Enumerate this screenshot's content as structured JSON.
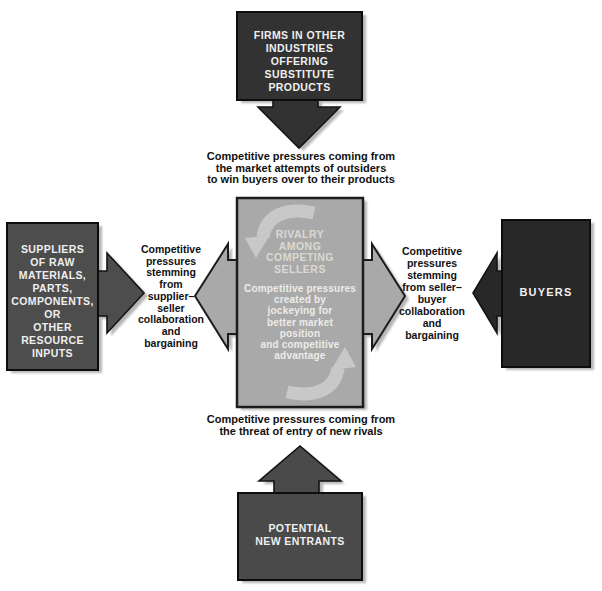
{
  "diagram": {
    "center": {
      "title": "RIVALRY\nAMONG\nCOMPETING\nSELLERS",
      "body": "Competitive pressures\ncreated by\njockeying for\nbetter market\nposition\nand competitive\nadvantage"
    },
    "boxes": {
      "top": {
        "label": "FIRMS IN OTHER\nINDUSTRIES\nOFFERING\nSUBSTITUTE\nPRODUCTS"
      },
      "left": {
        "label": "SUPPLIERS\nOF RAW\nMATERIALS,\nPARTS,\nCOMPONENTS,\nOR\nOTHER\nRESOURCE\nINPUTS"
      },
      "right": {
        "label": "BUYERS"
      },
      "bottom": {
        "label": "POTENTIAL\nNEW ENTRANTS"
      }
    },
    "captions": {
      "top": "Competitive pressures coming from\nthe market attempts of outsiders\nto win buyers over to their products",
      "left": "Competitive\npressures\nstemming\nfrom\nsupplier–\nseller\ncollaboration\nand\nbargaining",
      "right": "Competitive\npressures\nstemming\nfrom seller–\nbuyer\ncollaboration\nand\nbargaining",
      "bottom": "Competitive pressures coming from\nthe threat of entry of new rivals"
    },
    "colors": {
      "substitutes_box": "#323232",
      "suppliers_box": "#4d4d4d",
      "buyers_box": "#282828",
      "entrants_box": "#4a4a4a",
      "rivalry_box": "#a9a9a9",
      "rotate_arrow": "#c8c8c8",
      "shadow": "#b5b5b5",
      "box_text": "#efefef",
      "caption_text": "#111111"
    }
  }
}
